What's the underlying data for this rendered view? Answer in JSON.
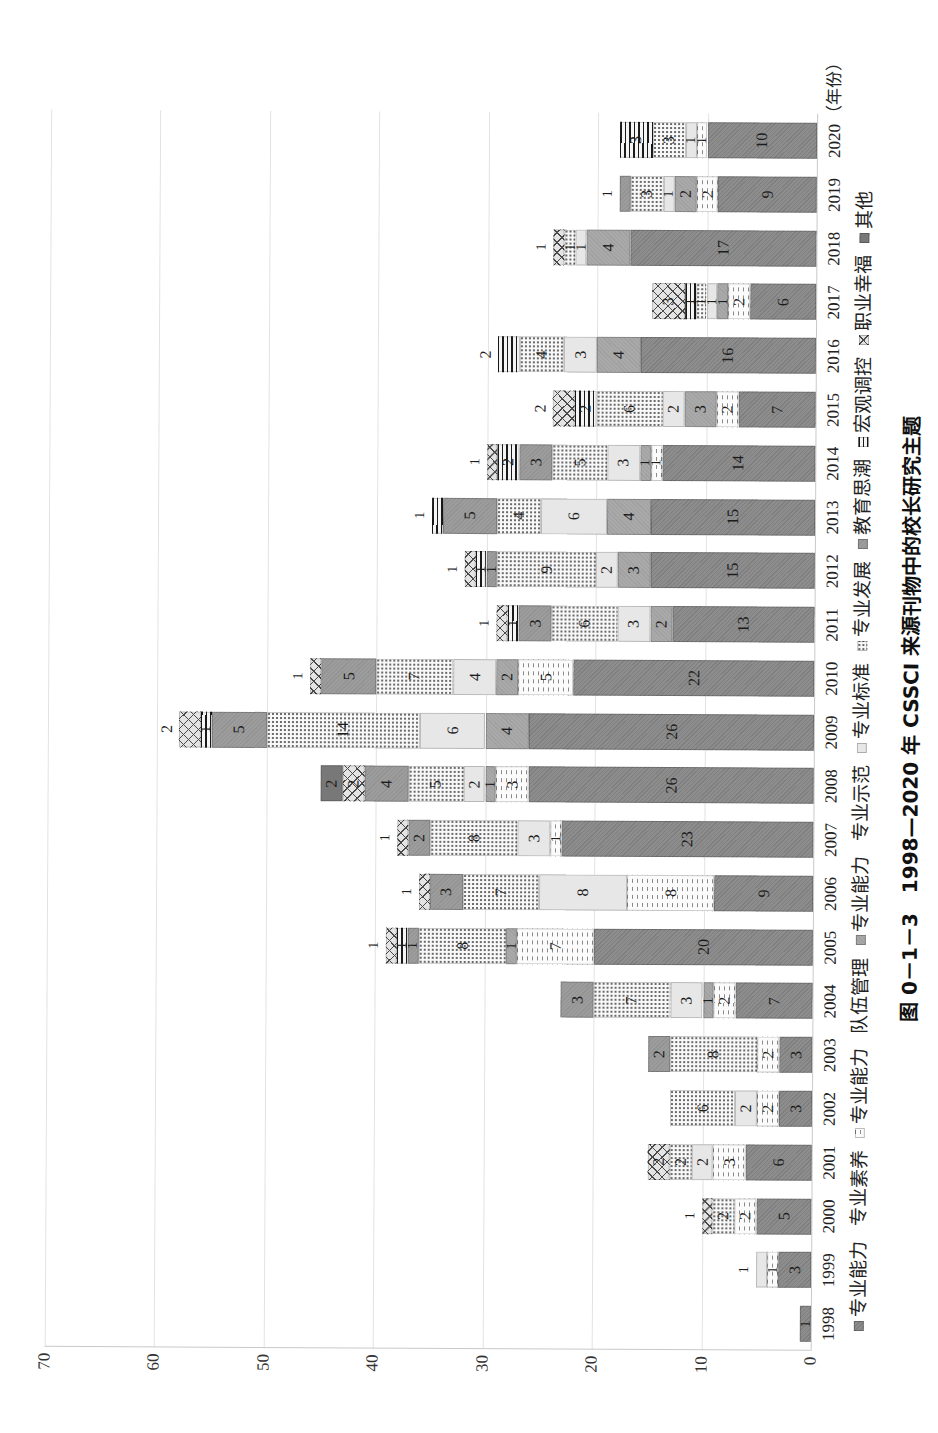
{
  "figure": {
    "caption": "图 0－1－3　1998—2020 年 CSSCI 来源刊物中的校长研究主题"
  },
  "chart_data": {
    "type": "bar",
    "stacked": true,
    "orientation": "vertical bars, image rotated 90° counter-clockwise",
    "title": "图 0－1－3　1998—2020 年 CSSCI 来源刊物中的校长研究主题",
    "xlabel": "（年份）",
    "ylabel": "",
    "ylim": [
      0,
      70
    ],
    "yticks": [
      0,
      10,
      20,
      30,
      40,
      50,
      60,
      70
    ],
    "grid": true,
    "legend_position": "bottom",
    "categories": [
      "1998",
      "1999",
      "2000",
      "2001",
      "2002",
      "2003",
      "2004",
      "2005",
      "2006",
      "2007",
      "2008",
      "2009",
      "2010",
      "2011",
      "2012",
      "2013",
      "2014",
      "2015",
      "2016",
      "2017",
      "2018",
      "2019",
      "2020"
    ],
    "series": [
      {
        "name": "专业能力 专业素养",
        "fill": "dark-texture",
        "color": "#8d8d8d",
        "values": [
          1,
          3,
          5,
          6,
          3,
          3,
          7,
          20,
          9,
          23,
          26,
          26,
          22,
          13,
          15,
          15,
          14,
          7,
          16,
          6,
          17,
          9,
          10
        ]
      },
      {
        "name": "专业能力 队伍管理",
        "fill": "wavy",
        "color": "#fbfbfb",
        "values": [
          0,
          1,
          2,
          3,
          2,
          2,
          2,
          7,
          8,
          1,
          3,
          0,
          5,
          0,
          0,
          0,
          1,
          2,
          0,
          2,
          0,
          2,
          1
        ]
      },
      {
        "name": "专业能力 专业示范",
        "fill": "medium-gray",
        "color": "#a9a9a9",
        "values": [
          0,
          0,
          0,
          0,
          0,
          0,
          1,
          1,
          0,
          0,
          1,
          4,
          2,
          2,
          3,
          4,
          1,
          3,
          4,
          1,
          4,
          2,
          0
        ]
      },
      {
        "name": "专业标准",
        "fill": "light-gray",
        "color": "#e7e7e7",
        "values": [
          0,
          1,
          0,
          2,
          2,
          0,
          3,
          0,
          8,
          3,
          2,
          6,
          4,
          3,
          2,
          6,
          3,
          2,
          3,
          1,
          1,
          1,
          1
        ]
      },
      {
        "name": "专业发展",
        "fill": "dotted",
        "color": "#f8f8f8",
        "values": [
          0,
          0,
          2,
          2,
          6,
          8,
          7,
          8,
          7,
          8,
          5,
          14,
          7,
          6,
          9,
          4,
          5,
          6,
          4,
          1,
          1,
          3,
          3
        ]
      },
      {
        "name": "教育思潮",
        "fill": "mid-gray",
        "color": "#9c9c9c",
        "values": [
          0,
          0,
          0,
          0,
          0,
          2,
          3,
          1,
          3,
          2,
          4,
          5,
          5,
          3,
          1,
          5,
          3,
          0,
          0,
          0,
          0,
          1,
          0
        ]
      },
      {
        "name": "宏观调控",
        "fill": "stripes",
        "color": "#1a1a1a",
        "values": [
          0,
          0,
          0,
          0,
          0,
          0,
          0,
          1,
          0,
          0,
          0,
          1,
          0,
          1,
          1,
          1,
          2,
          2,
          2,
          1,
          0,
          0,
          3
        ]
      },
      {
        "name": "职业幸福",
        "fill": "crosshatch",
        "color": "#e4e4e4",
        "values": [
          0,
          0,
          1,
          2,
          0,
          0,
          0,
          1,
          1,
          1,
          2,
          2,
          1,
          1,
          1,
          0,
          1,
          2,
          0,
          3,
          1,
          0,
          0
        ]
      },
      {
        "name": "其他",
        "fill": "dark-gray",
        "color": "#787878",
        "values": [
          0,
          0,
          0,
          0,
          0,
          0,
          0,
          0,
          0,
          0,
          2,
          0,
          0,
          0,
          0,
          0,
          0,
          0,
          0,
          0,
          0,
          0,
          0
        ]
      }
    ],
    "totals": [
      1,
      5,
      10,
      15,
      13,
      15,
      23,
      39,
      36,
      38,
      45,
      58,
      46,
      29,
      32,
      35,
      30,
      24,
      29,
      15,
      24,
      18,
      18
    ],
    "outside_top_label_categories": [
      "1999",
      "2000",
      "2005",
      "2006",
      "2007",
      "2009",
      "2010",
      "2011",
      "2012",
      "2013",
      "2014",
      "2015",
      "2016",
      "2018",
      "2019"
    ]
  }
}
